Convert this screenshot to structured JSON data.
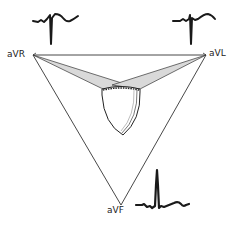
{
  "header": {
    "clipped_text": "— — —  — — —  — — — —"
  },
  "diagram": {
    "leads": [
      {
        "id": "avr",
        "label": "aVR",
        "vertex": [
          33,
          55
        ],
        "waveform": "negative QRS deflection, inverted T"
      },
      {
        "id": "avl",
        "label": "aVL",
        "vertex": [
          206,
          55
        ],
        "waveform": "small r, deep S, upright T"
      },
      {
        "id": "avf",
        "label": "aVF",
        "vertex": [
          121,
          205
        ],
        "waveform": "tall R, upright T"
      }
    ],
    "colors": {
      "line": "#333333",
      "wedge_fill": "#d9d9d9",
      "heart_stroke": "#222222",
      "waveform": "#1a1a1a"
    }
  }
}
